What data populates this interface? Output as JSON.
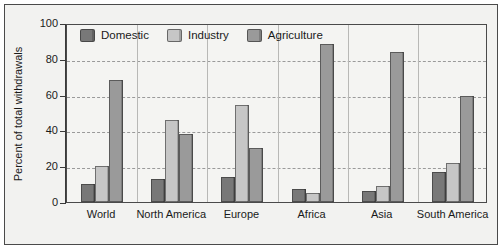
{
  "chart_data": {
    "type": "bar",
    "title": "",
    "xlabel": "",
    "ylabel": "Percent of total withdrawals",
    "ylim": [
      0,
      100
    ],
    "yticks": [
      0,
      20,
      40,
      60,
      80,
      100
    ],
    "grid": "horizontal-dashed",
    "legend_position": "top-left-inside",
    "categories": [
      "World",
      "North America",
      "Europe",
      "Africa",
      "Asia",
      "South America"
    ],
    "series": [
      {
        "name": "Domestic",
        "color": "#787878",
        "values": [
          10,
          13,
          14,
          7,
          6,
          17
        ]
      },
      {
        "name": "Industry",
        "color": "#c6c6c6",
        "values": [
          20,
          46,
          54,
          5,
          9,
          22
        ]
      },
      {
        "name": "Agriculture",
        "color": "#9a9a9a",
        "values": [
          68,
          38,
          30,
          88,
          84,
          59
        ]
      }
    ]
  },
  "axis": {
    "y_title": "Percent of total withdrawals",
    "y_tick_labels": [
      "100",
      "80",
      "60",
      "40",
      "20",
      "0"
    ]
  },
  "legend": {
    "items": [
      {
        "label": "Domestic",
        "color": "#787878"
      },
      {
        "label": "Industry",
        "color": "#c6c6c6"
      },
      {
        "label": "Agriculture",
        "color": "#9a9a9a"
      }
    ]
  }
}
